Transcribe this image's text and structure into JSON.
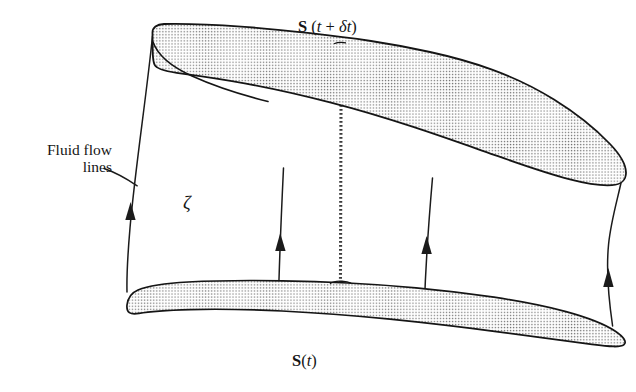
{
  "figure": {
    "domain_type": "diagram",
    "background_color": "#ffffff",
    "ink_color": "#151515",
    "stipple_color": "#6d6d6d",
    "width": 636,
    "height": 392
  },
  "labels": {
    "top_surface": {
      "full_text": "S (t + δt)",
      "bold_symbol": "S",
      "open_paren": " (",
      "var_t1": "t",
      "plus": " + ",
      "delta": "δ",
      "var_t2": "t",
      "close_paren": ")"
    },
    "bottom_surface": {
      "full_text": "S(t)",
      "bold_symbol": "S",
      "open_paren": "(",
      "var_t": "t",
      "close_paren": ")"
    },
    "zeta": {
      "glyph": "ζ",
      "name": "zeta"
    },
    "fluid_flow": {
      "line1": "Fluid flow",
      "line2": "lines"
    }
  },
  "geometry": {
    "top_surface": {
      "name": "S(t + delta t)",
      "fill": "stipple",
      "x_range": [
        152,
        626
      ],
      "y_range": [
        24,
        186
      ]
    },
    "bottom_surface": {
      "name": "S(t)",
      "fill": "stipple",
      "x_range": [
        127,
        627
      ],
      "y_range": [
        280,
        346
      ]
    },
    "flow_lines": [
      {
        "id": "flow-line-1",
        "style": "solid",
        "arrow": true,
        "top_x": 152,
        "top_y": 36,
        "bottom_x": 127,
        "bottom_y": 292,
        "arrow_y": 205
      },
      {
        "id": "flow-line-2",
        "style": "solid",
        "arrow": true,
        "top_x": 282,
        "top_y": 172,
        "bottom_x": 278,
        "bottom_y": 300,
        "arrow_y": 237
      },
      {
        "id": "flow-line-3",
        "style": "dotted",
        "arrow": false,
        "top_x": 341,
        "top_y": 45,
        "bottom_x": 340,
        "bottom_y": 300,
        "arrow_y": null
      },
      {
        "id": "flow-line-4",
        "style": "solid",
        "arrow": true,
        "top_x": 431,
        "top_y": 182,
        "bottom_x": 424,
        "bottom_y": 302,
        "arrow_y": 240
      },
      {
        "id": "flow-line-5",
        "style": "solid",
        "arrow": true,
        "top_x": 622,
        "top_y": 178,
        "bottom_x": 613,
        "bottom_y": 324,
        "arrow_y": 272
      }
    ],
    "leader_line": {
      "id": "fluid-flow-leader",
      "from": [
        110,
        172
      ],
      "to": [
        141,
        186
      ]
    }
  }
}
